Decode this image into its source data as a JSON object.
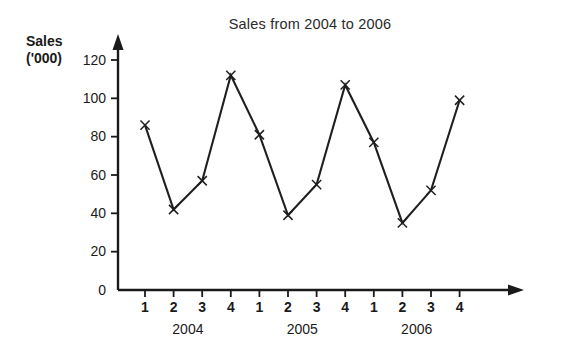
{
  "chart_data": {
    "type": "line",
    "title": "Sales from 2004 to 2006",
    "ylabel_line1": "Sales",
    "ylabel_line2": "('000)",
    "xlabel": "",
    "ylim": [
      0,
      120
    ],
    "yticks": [
      0,
      20,
      40,
      60,
      80,
      100,
      120
    ],
    "ytick_labels": [
      "0",
      "20",
      "40",
      "60",
      "80",
      "100",
      "120"
    ],
    "categories": [
      "1",
      "2",
      "3",
      "4",
      "1",
      "2",
      "3",
      "4",
      "1",
      "2",
      "3",
      "4"
    ],
    "values": [
      86,
      42,
      57,
      112,
      81,
      39,
      55,
      107,
      77,
      35,
      52,
      99
    ],
    "group_labels": [
      "2004",
      "2005",
      "2006"
    ],
    "groups": [
      {
        "label": "2004",
        "quarters": [
          "1",
          "2",
          "3",
          "4"
        ],
        "values": [
          86,
          42,
          57,
          112
        ]
      },
      {
        "label": "2005",
        "quarters": [
          "1",
          "2",
          "3",
          "4"
        ],
        "values": [
          81,
          39,
          55,
          107
        ]
      },
      {
        "label": "2006",
        "quarters": [
          "1",
          "2",
          "3",
          "4"
        ],
        "values": [
          77,
          35,
          52,
          99
        ]
      }
    ],
    "grid": false,
    "legend": "none",
    "marker": "x",
    "line_color": "#1f1f1f",
    "axis_color": "#1a1a1a",
    "has_axis_arrows": true
  }
}
